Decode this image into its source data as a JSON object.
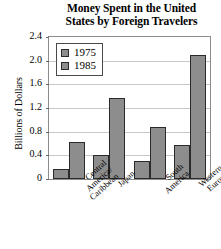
{
  "chart_data": {
    "type": "bar",
    "title": "Money Spent in the United States by Foreign Travelers",
    "title_lines": [
      "Money Spent in the United",
      "States by Foreign Travelers"
    ],
    "xlabel": "",
    "ylabel": "Billions of Dollars",
    "ylim": [
      0,
      2.4
    ],
    "yticks": [
      "0",
      "0.4",
      "0.8",
      "1.2",
      "1.6",
      "2.0",
      "2.4"
    ],
    "ytick_values": [
      0,
      0.4,
      0.8,
      1.2,
      1.6,
      2.0,
      2.4
    ],
    "grid": true,
    "legend_position": "upper-left-inside",
    "categories": [
      "Central America/ Caribbean",
      "Japan",
      "South America",
      "Western Europe"
    ],
    "category_lines": [
      [
        "Central",
        "America/",
        "Caribbean"
      ],
      [
        "Japan"
      ],
      [
        "South",
        "America"
      ],
      [
        "Western",
        "Europe"
      ]
    ],
    "series": [
      {
        "name": "1975",
        "color": "#8d8d8d",
        "values": [
          0.17,
          0.4,
          0.3,
          0.58
        ]
      },
      {
        "name": "1985",
        "color": "#8d8d8d",
        "values": [
          0.63,
          1.37,
          0.88,
          2.1
        ]
      }
    ]
  },
  "legend": {
    "entries": [
      {
        "label": "1975"
      },
      {
        "label": "1985"
      }
    ]
  },
  "colors": {
    "bar_fill": "#8d8d8d",
    "bar_stroke": "#2b2b2b",
    "grid": "#c8c8c8",
    "frame": "#8c8c8c",
    "background": "#ffffff"
  }
}
